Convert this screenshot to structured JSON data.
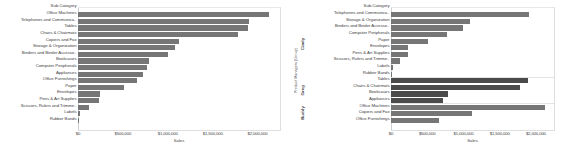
{
  "chart_data": [
    {
      "id": "left",
      "type": "bar",
      "orientation": "horizontal",
      "title": "",
      "xlabel": "Sales",
      "ylabel": "Sub-Category",
      "category_header": "Sub-Category",
      "xlim": [
        0,
        2250000
      ],
      "xticks": [
        0,
        500000,
        1000000,
        1500000,
        2000000
      ],
      "xticklabels": [
        "$0",
        "$500,000",
        "$1,000,000",
        "$1,500,000",
        "$2,000,000"
      ],
      "grid": false,
      "legend": "none",
      "bar_color": "#767676",
      "categories": [
        "Office Machines",
        "Telephones and Communica..",
        "Tables",
        "Chairs & Chairmats",
        "Copiers and Fax",
        "Storage & Organization",
        "Binders and Binder Accesso..",
        "Bookcases",
        "Computer Peripherals",
        "Appliances",
        "Office Furnishings",
        "Paper",
        "Envelopes",
        "Pens & Art Supplies",
        "Scissors, Rulers and Trimme..",
        "Labels",
        "Rubber Bands"
      ],
      "values": [
        2130000,
        1900000,
        1890000,
        1780000,
        1120000,
        1080000,
        1000000,
        790000,
        770000,
        720000,
        660000,
        510000,
        240000,
        230000,
        120000,
        25000,
        12000
      ]
    },
    {
      "id": "right",
      "type": "bar",
      "orientation": "horizontal",
      "title": "",
      "xlabel": "Sales",
      "ylabel": "Product Managers (Group)",
      "category_header": "Sub-Category",
      "xlim": [
        0,
        2250000
      ],
      "xticks": [
        0,
        500000,
        1000000,
        1500000,
        2000000
      ],
      "xticklabels": [
        "$0",
        "$500,000",
        "$1,000,000",
        "$1,500,000",
        "$2,000,000"
      ],
      "grid": false,
      "legend": "none",
      "groups": [
        {
          "name": "Cindy",
          "bar_color": "#767676",
          "categories": [
            "Telephones and Communica..",
            "Storage & Organization",
            "Binders and Binder Accesso..",
            "Computer Peripherals",
            "Paper",
            "Envelopes",
            "Pens & Art Supplies",
            "Scissors, Rulers and Trimme..",
            "Labels",
            "Rubber Bands"
          ],
          "values": [
            1900000,
            1090000,
            1000000,
            770000,
            510000,
            240000,
            230000,
            120000,
            25000,
            12000
          ]
        },
        {
          "name": "Greg",
          "bar_color": "#4b4b4b",
          "categories": [
            "Tables",
            "Chairs & Chairmats",
            "Bookcases",
            "Appliances"
          ],
          "values": [
            1890000,
            1780000,
            790000,
            720000
          ]
        },
        {
          "name": "Buddy",
          "bar_color": "#767676",
          "categories": [
            "Office Machines",
            "Copiers and Fax",
            "Office Furnishings"
          ],
          "values": [
            2130000,
            1120000,
            660000
          ]
        }
      ]
    }
  ]
}
